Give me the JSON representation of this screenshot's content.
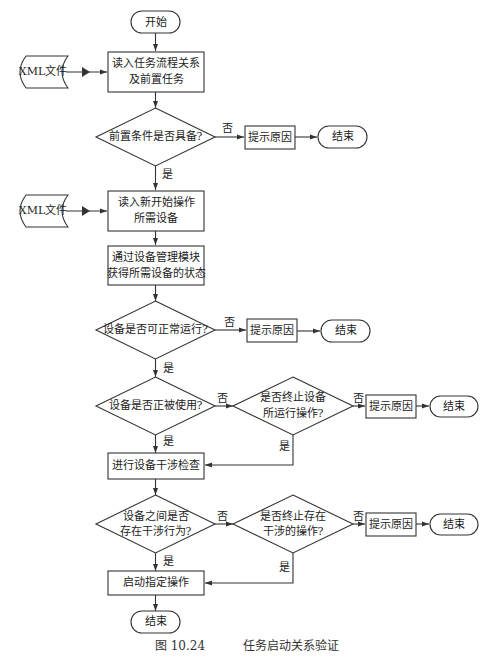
{
  "caption": {
    "number": "图 10.24",
    "title": "任务启动关系验证"
  },
  "nodes": {
    "start": "开始",
    "xml1": "XML文件",
    "read_task_1": "读入任务流程关系",
    "read_task_2": "及前置任务",
    "cond_precondition": "前置条件是否具备?",
    "hint1": "提示原因",
    "end1": "结束",
    "xml2": "XML文件",
    "read_dev_1": "读入新开始操作",
    "read_dev_2": "所需设备",
    "get_state_1": "通过设备管理模块",
    "get_state_2": "获得所需设备的状态",
    "cond_running": "设备是否可正常运行?",
    "hint2": "提示原因",
    "end2": "结束",
    "cond_in_use": "设备是否正被使用?",
    "cond_stop_1": "是否终止设备",
    "cond_stop_2": "所运行操作?",
    "hint3": "提示原因",
    "end3": "结束",
    "check_interference": "进行设备干涉检查",
    "cond_interfere_1": "设备之间是否",
    "cond_interfere_2": "存在干涉行为?",
    "cond_stop_int_1": "是否终止存在",
    "cond_stop_int_2": "干涉的操作?",
    "hint4": "提示原因",
    "end4": "结束",
    "launch": "启动指定操作",
    "end_final": "结束"
  },
  "edge_labels": {
    "yes": "是",
    "no": "否"
  },
  "colors": {
    "stroke": "#333333",
    "text": "#222222",
    "background": "#ffffff"
  }
}
